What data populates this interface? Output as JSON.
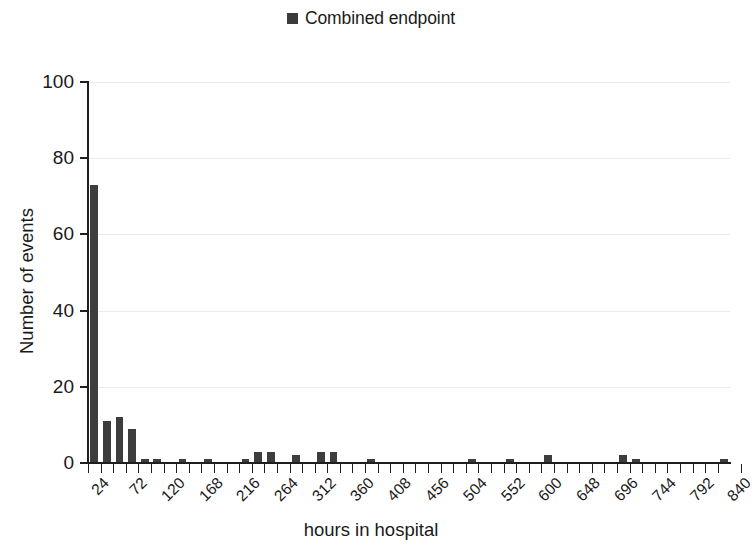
{
  "chart_data": {
    "type": "bar",
    "title": "",
    "xlabel": "hours in hospital",
    "ylabel": "Number of events",
    "ylim": [
      0,
      100
    ],
    "ytick_labels": [
      "100",
      "80",
      "60",
      "40",
      "20",
      "0"
    ],
    "ytick_values": [
      100,
      80,
      60,
      40,
      20,
      0
    ],
    "grid": true,
    "grid_axis": "y",
    "legend_position": "top-center",
    "bar_color": "#3d3d3d",
    "legend": [
      {
        "label": "Combined endpoint",
        "marker": "square",
        "color": "#3d3d3d"
      }
    ],
    "series": [
      {
        "name": "Combined endpoint",
        "values": [
          73,
          11,
          12,
          9,
          1,
          1,
          0,
          1,
          0,
          1,
          0,
          0,
          1,
          3,
          3,
          0,
          2,
          0,
          3,
          3,
          0,
          0,
          1,
          0,
          0,
          0,
          0,
          0,
          0,
          0,
          1,
          0,
          0,
          1,
          0,
          0,
          2,
          0,
          0,
          0,
          0,
          0,
          2,
          1,
          0,
          0,
          0,
          0,
          0,
          0,
          1
        ]
      }
    ],
    "categories": [
      "24",
      "40",
      "56",
      "72",
      "88",
      "104",
      "120",
      "136",
      "152",
      "168",
      "184",
      "200",
      "216",
      "232",
      "248",
      "264",
      "280",
      "296",
      "312",
      "328",
      "344",
      "360",
      "376",
      "392",
      "408",
      "424",
      "440",
      "456",
      "472",
      "488",
      "504",
      "520",
      "536",
      "552",
      "568",
      "584",
      "600",
      "616",
      "632",
      "648",
      "664",
      "680",
      "696",
      "712",
      "728",
      "744",
      "760",
      "776",
      "792",
      "808",
      "824"
    ],
    "xtick_labels": [
      "24",
      "72",
      "120",
      "168",
      "216",
      "264",
      "312",
      "360",
      "408",
      "456",
      "504",
      "552",
      "600",
      "648",
      "696",
      "744",
      "792",
      "840"
    ],
    "xtick_label_every": 3,
    "xtick_label_rotation": -45
  }
}
